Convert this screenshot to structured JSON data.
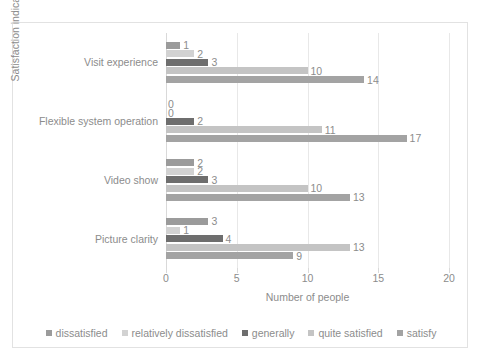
{
  "chart_data": {
    "type": "bar",
    "orientation": "horizontal",
    "title": "",
    "xlabel": "Number of people",
    "ylabel": "Satisfaction indicator",
    "xlim": [
      0,
      20
    ],
    "xticks": [
      "0",
      "5",
      "10",
      "15",
      "20"
    ],
    "grid": true,
    "legend_position": "bottom",
    "categories": [
      "Visit experience",
      "Flexible system operation",
      "Video show",
      "Picture clarity"
    ],
    "series": [
      {
        "name": "dissatisfied",
        "color": "#9b9b9b",
        "values": [
          1,
          0,
          2,
          3
        ]
      },
      {
        "name": "relatively dissatisfied",
        "color": "#d2d2d2",
        "values": [
          2,
          0,
          2,
          1
        ]
      },
      {
        "name": "generally",
        "color": "#6e6e6e",
        "values": [
          3,
          2,
          3,
          4
        ]
      },
      {
        "name": "quite satisfied",
        "color": "#c4c4c4",
        "values": [
          10,
          11,
          10,
          13
        ]
      },
      {
        "name": "satisfy",
        "color": "#a3a3a3",
        "values": [
          14,
          17,
          13,
          9
        ]
      }
    ]
  }
}
